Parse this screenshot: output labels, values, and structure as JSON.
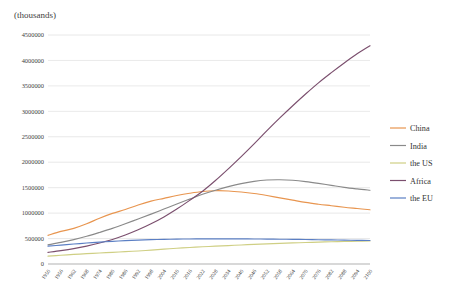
{
  "chart_data": {
    "type": "line",
    "title": "",
    "unit_label": "(thousands)",
    "xlabel": "",
    "ylabel": "",
    "ylim": [
      0,
      4500000
    ],
    "ytick_step": 500000,
    "yticks": [
      0,
      500000,
      1000000,
      1500000,
      2000000,
      2500000,
      3000000,
      3500000,
      4000000,
      4500000
    ],
    "ytick_labels": [
      "0",
      "500000",
      "1000000",
      "1500000",
      "2000000",
      "2500000",
      "3000000",
      "3500000",
      "4000000",
      "4500000"
    ],
    "grid": true,
    "legend_position": "right",
    "x": [
      1950,
      1956,
      1962,
      1968,
      1974,
      1980,
      1986,
      1992,
      1998,
      2004,
      2010,
      2016,
      2022,
      2028,
      2034,
      2040,
      2046,
      2052,
      2058,
      2064,
      2070,
      2076,
      2082,
      2088,
      2094,
      2100
    ],
    "xtick_labels": [
      "1950",
      "1956",
      "1962",
      "1968",
      "1974",
      "1980",
      "1986",
      "1992",
      "1998",
      "2004",
      "2010",
      "2016",
      "2022",
      "2028",
      "2034",
      "2040",
      "2046",
      "2052",
      "2058",
      "2064",
      "2070",
      "2076",
      "2082",
      "2088",
      "2094",
      "2100"
    ],
    "series": [
      {
        "name": "China",
        "color": "#e8954f",
        "values": [
          563000,
          640000,
          700000,
          790000,
          900000,
          995000,
          1070000,
          1160000,
          1235000,
          1290000,
          1345000,
          1390000,
          1425000,
          1440000,
          1435000,
          1415000,
          1385000,
          1345000,
          1300000,
          1255000,
          1210000,
          1175000,
          1145000,
          1115000,
          1090000,
          1065000
        ]
      },
      {
        "name": "India",
        "color": "#8a8a8a",
        "values": [
          376000,
          425000,
          480000,
          545000,
          620000,
          700000,
          790000,
          885000,
          980000,
          1080000,
          1180000,
          1275000,
          1370000,
          1450000,
          1520000,
          1580000,
          1625000,
          1650000,
          1655000,
          1645000,
          1620000,
          1585000,
          1545000,
          1505000,
          1475000,
          1450000
        ]
      },
      {
        "name": "the US",
        "color": "#cfcf84"
      },
      {
        "name": "Africa",
        "color": "#7b4f6e"
      },
      {
        "name": "the EU",
        "color": "#5b7fc4"
      }
    ],
    "series_values": {
      "the US": [
        155000,
        172000,
        188000,
        203000,
        216000,
        229000,
        242000,
        256000,
        272000,
        292000,
        310000,
        325000,
        338000,
        350000,
        362000,
        374000,
        385000,
        396000,
        405000,
        414000,
        422000,
        430000,
        437000,
        442000,
        447000,
        452000
      ],
      "Africa": [
        228000,
        262000,
        302000,
        352000,
        412000,
        482000,
        570000,
        672000,
        790000,
        925000,
        1080000,
        1250000,
        1430000,
        1640000,
        1870000,
        2110000,
        2360000,
        2620000,
        2870000,
        3110000,
        3340000,
        3560000,
        3760000,
        3950000,
        4130000,
        4290000
      ]
    },
    "series_values_eu": [
      350000,
      372000,
      392000,
      412000,
      430000,
      445000,
      458000,
      468000,
      478000,
      484000,
      489000,
      492000,
      494000,
      495000,
      495000,
      494000,
      492000,
      490000,
      487000,
      484000,
      481000,
      477000,
      473000,
      469000,
      465000,
      462000
    ]
  },
  "legend": {
    "items": [
      {
        "label": "China",
        "color": "#e8954f"
      },
      {
        "label": "India",
        "color": "#8a8a8a"
      },
      {
        "label": "the US",
        "color": "#cfcf84"
      },
      {
        "label": "Africa",
        "color": "#7b4f6e"
      },
      {
        "label": "the EU",
        "color": "#5b7fc4"
      }
    ]
  }
}
